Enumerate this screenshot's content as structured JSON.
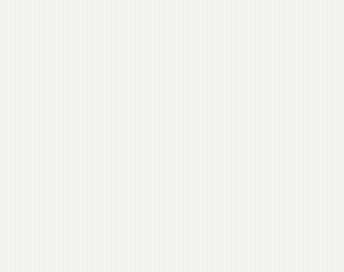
{
  "figure": {
    "background_color": "#fbfbfa",
    "ink_color": "#1e1e1e"
  },
  "axes": {
    "y_label_main": "E",
    "y_label_sub": "SCE",
    "y_label_unit": "/V",
    "x_label_main": "i",
    "x_label_unit": "/(A/cm",
    "x_label_unit_sup": "2",
    "x_label_unit_end": ")",
    "y_ticks": [
      "0.6",
      "0.4",
      "0.2",
      "0.0",
      "-0.2",
      "-0.4",
      "-0.6",
      "-0.8",
      "-1.0",
      "-1.2"
    ],
    "x_tick_bases": [
      "10",
      "10",
      "10",
      "10",
      "10",
      "10",
      "10"
    ],
    "x_tick_exponents": [
      "-9",
      "-8",
      "-7",
      "-6",
      "-5",
      "-4",
      "-3"
    ]
  },
  "legend": {
    "items": [
      {
        "label": "10d",
        "marker": "open-circle"
      },
      {
        "label": "30d",
        "marker": "filled-circle"
      },
      {
        "label": "50d",
        "marker": "open-triangle"
      }
    ]
  },
  "chart_data": {
    "type": "line",
    "title": "",
    "xlabel": "i/(A/cm2)",
    "ylabel": "E_SCE/V",
    "xscale": "log",
    "xlim": [
      1e-09,
      0.001
    ],
    "ylim": [
      -1.2,
      0.6
    ],
    "grid": false,
    "legend_position": "upper-center",
    "series": [
      {
        "name": "10d",
        "marker": "open-circle",
        "e_corr": -0.83,
        "i_corr": 3.2e-06,
        "cathodic": [
          {
            "i": 7.5e-09,
            "E": -0.855
          },
          {
            "i": 3e-08,
            "E": -0.853
          },
          {
            "i": 1.2e-07,
            "E": -0.851
          },
          {
            "i": 4e-07,
            "E": -0.848
          },
          {
            "i": 9e-07,
            "E": -0.845
          },
          {
            "i": 1.8e-06,
            "E": -0.84
          },
          {
            "i": 2.6e-06,
            "E": -0.836
          },
          {
            "i": 3.2e-06,
            "E": -0.83
          }
        ],
        "cathodic_tail": [
          {
            "i": 3.2e-06,
            "E": -0.83
          },
          {
            "i": 6e-06,
            "E": -0.87
          },
          {
            "i": 1.4e-05,
            "E": -0.92
          },
          {
            "i": 3.5e-05,
            "E": -0.96
          },
          {
            "i": 9e-05,
            "E": -0.988
          },
          {
            "i": 0.00019,
            "E": -1.0
          }
        ],
        "anodic": [
          {
            "i": 3.2e-06,
            "E": -0.83
          },
          {
            "i": 8e-06,
            "E": -0.8
          },
          {
            "i": 2e-05,
            "E": -0.76
          },
          {
            "i": 5e-05,
            "E": -0.7
          },
          {
            "i": 0.00011,
            "E": -0.6
          },
          {
            "i": 0.00019,
            "E": -0.46
          },
          {
            "i": 0.0003,
            "E": -0.26
          },
          {
            "i": 0.00042,
            "E": -0.02
          },
          {
            "i": 0.00052,
            "E": 0.18
          },
          {
            "i": 0.00058,
            "E": 0.28
          }
        ]
      },
      {
        "name": "30d",
        "marker": "filled-circle",
        "e_corr": -0.84,
        "i_corr": 3e-06,
        "cathodic": [
          {
            "i": 4.5e-09,
            "E": -0.9
          },
          {
            "i": 2e-08,
            "E": -0.893
          },
          {
            "i": 1e-07,
            "E": -0.885
          },
          {
            "i": 4e-07,
            "E": -0.872
          },
          {
            "i": 1e-06,
            "E": -0.86
          },
          {
            "i": 2e-06,
            "E": -0.85
          },
          {
            "i": 3e-06,
            "E": -0.84
          }
        ],
        "cathodic_tail": [
          {
            "i": 3e-06,
            "E": -0.84
          },
          {
            "i": 7e-06,
            "E": -0.885
          },
          {
            "i": 1.6e-05,
            "E": -0.93
          },
          {
            "i": 4e-05,
            "E": -0.968
          },
          {
            "i": 0.0001,
            "E": -0.992
          },
          {
            "i": 0.00019,
            "E": -1.002
          }
        ],
        "anodic": [
          {
            "i": 3e-06,
            "E": -0.84
          },
          {
            "i": 7.5e-06,
            "E": -0.808
          },
          {
            "i": 1.9e-05,
            "E": -0.768
          },
          {
            "i": 4.8e-05,
            "E": -0.71
          },
          {
            "i": 0.0001,
            "E": -0.615
          },
          {
            "i": 0.00018,
            "E": -0.48
          },
          {
            "i": 0.00029,
            "E": -0.285
          },
          {
            "i": 0.0004,
            "E": -0.05
          },
          {
            "i": 0.0005,
            "E": 0.16
          },
          {
            "i": 0.00057,
            "E": 0.275
          }
        ]
      },
      {
        "name": "50d",
        "marker": "open-triangle",
        "e_corr": -0.835,
        "i_corr": 3.1e-06,
        "cathodic": [
          {
            "i": 1.5e-07,
            "E": -0.862
          },
          {
            "i": 5e-07,
            "E": -0.856
          },
          {
            "i": 1.2e-06,
            "E": -0.848
          },
          {
            "i": 2.2e-06,
            "E": -0.842
          },
          {
            "i": 3.1e-06,
            "E": -0.835
          }
        ],
        "cathodic_tail": [
          {
            "i": 3.1e-06,
            "E": -0.835
          },
          {
            "i": 6.5e-06,
            "E": -0.878
          },
          {
            "i": 1.5e-05,
            "E": -0.925
          },
          {
            "i": 3.8e-05,
            "E": -0.963
          },
          {
            "i": 9.5e-05,
            "E": -0.99
          },
          {
            "i": 0.00021,
            "E": -1.003
          }
        ],
        "anodic": [
          {
            "i": 3.1e-06,
            "E": -0.835
          },
          {
            "i": 7.8e-06,
            "E": -0.804
          },
          {
            "i": 1.95e-05,
            "E": -0.764
          },
          {
            "i": 4.9e-05,
            "E": -0.705
          },
          {
            "i": 0.000105,
            "E": -0.608
          },
          {
            "i": 0.000185,
            "E": -0.47
          },
          {
            "i": 0.000295,
            "E": -0.272
          },
          {
            "i": 0.00041,
            "E": -0.035
          },
          {
            "i": 0.00051,
            "E": 0.17
          },
          {
            "i": 0.000575,
            "E": 0.278
          }
        ]
      }
    ]
  }
}
